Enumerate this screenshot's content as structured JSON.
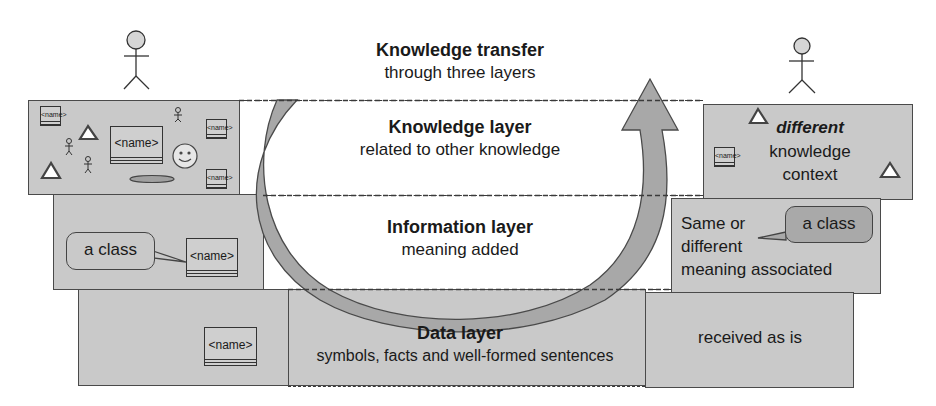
{
  "header": {
    "title": "Knowledge transfer",
    "subtitle": "through three layers"
  },
  "layers": [
    {
      "title": "Knowledge layer",
      "subtitle": "related to other knowledge"
    },
    {
      "title": "Information layer",
      "subtitle": "meaning added"
    },
    {
      "title": "Data layer",
      "subtitle": "symbols, facts and well-formed sentences"
    }
  ],
  "sender": {
    "knowledge": {
      "class_label": "<name>",
      "small_class_label": "<name>"
    },
    "information": {
      "callout": "a class",
      "class_label": "<name>"
    },
    "data": {
      "class_label": "<name>"
    }
  },
  "receiver": {
    "knowledge": {
      "emphasis": "different",
      "line2": "knowledge",
      "line3": "context",
      "small_class_label": "<name>"
    },
    "information": {
      "line1": "Same or",
      "line2": "different",
      "line3": "meaning associated",
      "callout": "a class"
    },
    "data": {
      "text": "received as is"
    }
  },
  "colors": {
    "box_fill": "#c9c9c9",
    "ring_fill": "#a8a8a8",
    "callout_dark": "#a9a9a9",
    "stroke": "#4a4a4a"
  }
}
